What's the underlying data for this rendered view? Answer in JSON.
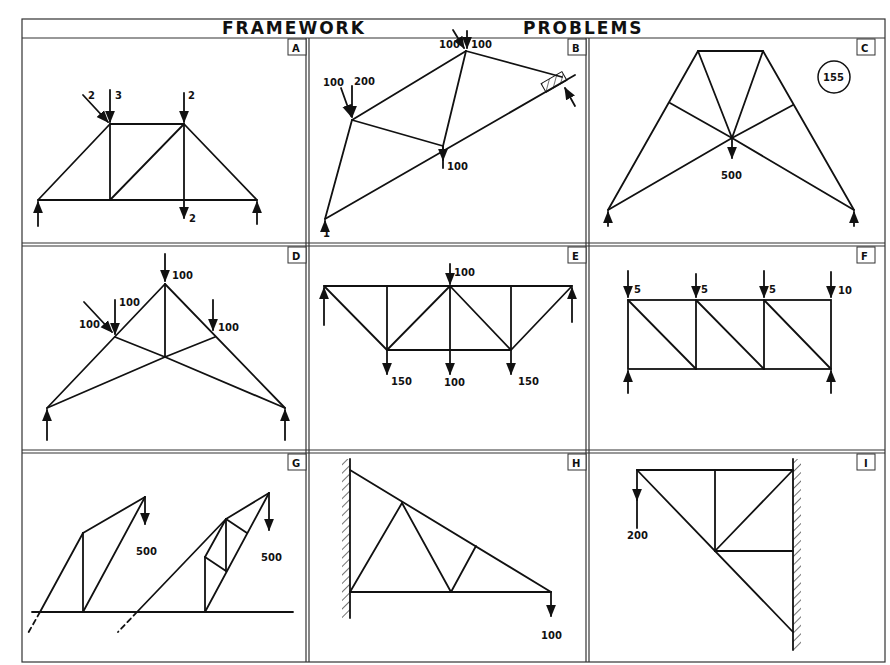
{
  "title": {
    "left": "FRAMEWORK",
    "right": "PROBLEMS"
  },
  "page_number": "155",
  "panels": [
    {
      "id": "A",
      "loads": [
        "2",
        "3",
        "2",
        "2"
      ]
    },
    {
      "id": "B",
      "loads": [
        "100",
        "100",
        "100",
        "200",
        "100",
        "1"
      ]
    },
    {
      "id": "C",
      "loads": [
        "500"
      ]
    },
    {
      "id": "D",
      "loads": [
        "100",
        "100",
        "100",
        "100"
      ]
    },
    {
      "id": "E",
      "loads": [
        "100",
        "150",
        "100",
        "150"
      ]
    },
    {
      "id": "F",
      "loads": [
        "5",
        "5",
        "5",
        "10"
      ]
    },
    {
      "id": "G",
      "loads": [
        "500",
        "500"
      ]
    },
    {
      "id": "H",
      "loads": [
        "100"
      ]
    },
    {
      "id": "I",
      "loads": [
        "200"
      ]
    }
  ]
}
